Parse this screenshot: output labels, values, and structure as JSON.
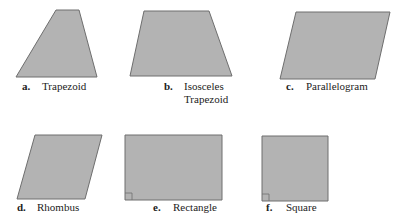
{
  "colors": {
    "fill": "#b3b3b3",
    "stroke": "#6e6e6e",
    "text": "#222222"
  },
  "shapes": [
    {
      "id": "a",
      "letter": "a.",
      "name": "Trapezoid",
      "points": "56,10 79,10 97,77 16,77"
    },
    {
      "id": "b",
      "letter": "b.",
      "name": "Isosceles",
      "name2": "Trapezoid",
      "points": "144,11 209,11 232,76 130,76"
    },
    {
      "id": "c",
      "letter": "c.",
      "name": "Parallelogram",
      "points": "296,12 390,12 375,79 280,79"
    },
    {
      "id": "d",
      "letter": "d.",
      "name": "Rhombus",
      "points": "35,135 102,135 85,199 17,199"
    },
    {
      "id": "e",
      "letter": "e.",
      "name": "Rectangle",
      "points": "125,135 222,135 222,200 125,200"
    },
    {
      "id": "f",
      "letter": "f.",
      "name": "Square",
      "points": "262,136 328,136 328,201 262,201"
    }
  ]
}
